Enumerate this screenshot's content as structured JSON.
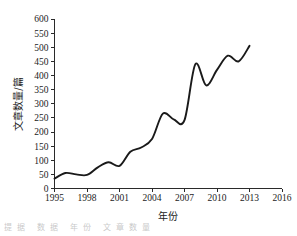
{
  "chart_data": {
    "type": "line",
    "title": "",
    "xlabel": "年份",
    "ylabel": "文章数量/篇",
    "xlim": [
      1995,
      2016
    ],
    "ylim": [
      0,
      600
    ],
    "grid": false,
    "legend": null,
    "x_ticks": [
      "1995",
      "1998",
      "2001",
      "2004",
      "2007",
      "2010",
      "2013",
      "2016"
    ],
    "x_tick_values": [
      1995,
      1998,
      2001,
      2004,
      2007,
      2010,
      2013,
      2016
    ],
    "y_ticks": [
      "0",
      "50",
      "100",
      "150",
      "200",
      "250",
      "300",
      "350",
      "400",
      "450",
      "500",
      "550",
      "600"
    ],
    "y_tick_values": [
      0,
      50,
      100,
      150,
      200,
      250,
      300,
      350,
      400,
      450,
      500,
      550,
      600
    ],
    "x": [
      1995,
      1996,
      1997,
      1998,
      1999,
      2000,
      2001,
      2002,
      2003,
      2004,
      2005,
      2006,
      2007,
      2008,
      2009,
      2010,
      2011,
      2012,
      2013
    ],
    "values": [
      35,
      55,
      50,
      48,
      75,
      93,
      80,
      130,
      145,
      175,
      265,
      245,
      242,
      440,
      365,
      420,
      470,
      450,
      505
    ],
    "series": [
      {
        "name": "文章数量",
        "color": "#1a1a1a",
        "values": [
          35,
          55,
          50,
          48,
          75,
          93,
          80,
          130,
          145,
          175,
          265,
          245,
          242,
          440,
          365,
          420,
          470,
          450,
          505
        ]
      }
    ]
  },
  "figure": {
    "axis_color": "#2a2a2a",
    "curve_color": "#1a1a1a",
    "background": "#ffffff",
    "caption_fragment": "提据       数据    年份 文章数量"
  }
}
